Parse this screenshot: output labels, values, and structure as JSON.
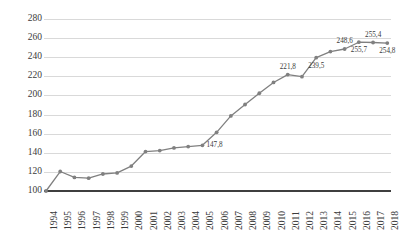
{
  "chart_data": {
    "type": "line",
    "title": "",
    "subtitle": "",
    "xlabel": "",
    "ylabel": "",
    "ylim": [
      100,
      280
    ],
    "ytick_step": 20,
    "grid": true,
    "legend": false,
    "legend_position": "none",
    "marker": "circle",
    "series_color": "#808080",
    "gridline_color": "#D9D9D9",
    "axis_color": "#3F3F3F",
    "categories": [
      "1994",
      "1995",
      "1996",
      "1997",
      "1998",
      "1999",
      "2000",
      "2001",
      "2002",
      "2003",
      "2004",
      "2005",
      "2006",
      "2007",
      "2008",
      "2009",
      "2010",
      "2011",
      "2012",
      "2013",
      "2014",
      "2015",
      "2016",
      "2017",
      "2018"
    ],
    "values": [
      100.0,
      120.4,
      114.2,
      113.4,
      117.8,
      118.9,
      126.1,
      141.3,
      142.3,
      145.1,
      146.5,
      147.8,
      161.4,
      178.6,
      190.5,
      202.3,
      213.6,
      221.8,
      219.6,
      239.5,
      245.9,
      248.6,
      255.7,
      255.4,
      254.8
    ],
    "yticks": [
      100,
      120,
      140,
      160,
      180,
      200,
      220,
      240,
      260,
      280
    ],
    "ytick_labels": [
      "100",
      "120",
      "140",
      "160",
      "180",
      "200",
      "220",
      "240",
      "260",
      "280"
    ],
    "data_labels": [
      {
        "index": 11,
        "text": "147,8",
        "position": "right"
      },
      {
        "index": 17,
        "text": "221,8",
        "position": "above"
      },
      {
        "index": 19,
        "text": "239,5",
        "position": "below"
      },
      {
        "index": 21,
        "text": "248,6",
        "position": "above"
      },
      {
        "index": 22,
        "text": "255,7",
        "position": "below"
      },
      {
        "index": 23,
        "text": "255,4",
        "position": "above"
      },
      {
        "index": 24,
        "text": "254,8",
        "position": "below"
      }
    ]
  }
}
